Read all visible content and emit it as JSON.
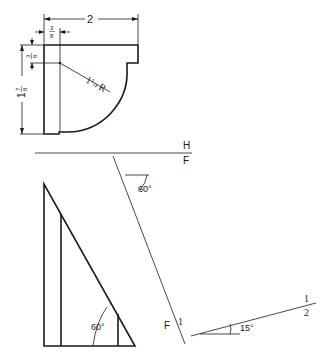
{
  "top_view": {
    "width_dim": "2",
    "flange_dim": "3/8",
    "flange_dim_num": "3",
    "flange_dim_den": "8",
    "thickness_dim_num": "3",
    "thickness_dim_den": "8",
    "height_dim_whole": "1",
    "height_dim_num": "7",
    "height_dim_den": "8",
    "radius_label": "1 1/4 R",
    "radius_whole": "1",
    "radius_num": "1",
    "radius_den": "4",
    "radius_suffix": "R"
  },
  "reference_line_HF": {
    "upper_label": "H",
    "lower_label": "F"
  },
  "auxiliary_line": {
    "angle_label": "60°",
    "end_label_left": "F",
    "end_label_right": "1"
  },
  "triangle_view": {
    "angle_label": "60°"
  },
  "reference_line_12": {
    "angle_label": "15°",
    "upper_label": "1",
    "lower_label": "2"
  }
}
